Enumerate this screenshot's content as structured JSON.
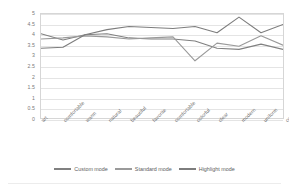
{
  "chart_data": {
    "type": "line",
    "title": "",
    "xlabel": "",
    "ylabel": "",
    "ylim": [
      0,
      5
    ],
    "ytick_step": 0.5,
    "grid": true,
    "legend_position": "bottom",
    "categories": [
      "art",
      "comfortable",
      "warm",
      "natural",
      "beautiful",
      "favorite",
      "comfortable",
      "colorful",
      "clear",
      "modern",
      "uniform",
      "comfortable"
    ],
    "yticks": [
      "0",
      "0.5",
      "1",
      "1.5",
      "2",
      "2.5",
      "3",
      "3.5",
      "4",
      "4.5",
      "5"
    ],
    "series": [
      {
        "name": "Custom mode",
        "color": "#808080",
        "values": [
          4.05,
          3.75,
          4.0,
          4.05,
          3.85,
          3.8,
          3.8,
          3.7,
          3.35,
          3.3,
          3.55,
          3.3
        ]
      },
      {
        "name": "Standard mode",
        "color": "#9a9a9a",
        "values": [
          3.8,
          3.85,
          3.95,
          3.9,
          3.8,
          3.85,
          3.9,
          2.75,
          3.6,
          3.45,
          3.95,
          3.5
        ]
      },
      {
        "name": "Highlight mode",
        "color": "#7d7d7d",
        "values": [
          3.35,
          3.4,
          4.0,
          4.25,
          4.4,
          4.35,
          4.3,
          4.4,
          4.1,
          4.85,
          4.1,
          4.5
        ]
      }
    ]
  }
}
